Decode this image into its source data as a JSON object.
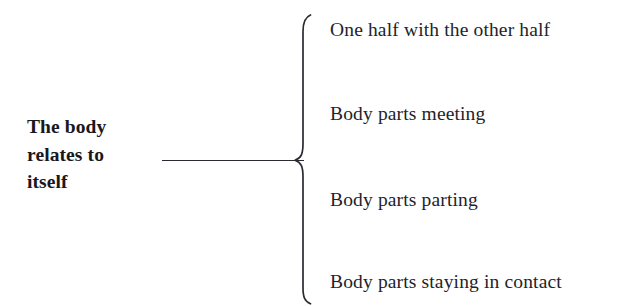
{
  "diagram": {
    "type": "bracket-tree",
    "background_color": "#ffffff",
    "ink_color": "#232329",
    "root": {
      "label": "The body relates to itself",
      "label_lines": "The body\nrelates to\nitself",
      "emphasis": "bold"
    },
    "connector": {
      "trunk_label": "trunk-line",
      "brace_label": "curly-brace",
      "brace_orientation": "left-facing-open-right"
    },
    "branches": [
      {
        "label": "One half with the other half"
      },
      {
        "label": "Body parts meeting"
      },
      {
        "label": "Body parts parting"
      },
      {
        "label": "Body parts staying in contact"
      }
    ]
  }
}
